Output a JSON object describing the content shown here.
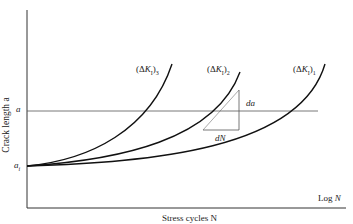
{
  "figure": {
    "y_axis_label": "Crack length a",
    "x_axis_label": "Stress cycles N",
    "x_axis_scale_label": "Log N",
    "y_levels": {
      "a": "a",
      "a_i": "a_i"
    },
    "curves": [
      {
        "label": "(ΔK_I)_3",
        "text": "(ΔK",
        "sub1": "I",
        "sub2": "3"
      },
      {
        "label": "(ΔK_I)_2",
        "text": "(ΔK",
        "sub1": "I",
        "sub2": "2"
      },
      {
        "label": "(ΔK_I)_1",
        "text": "(ΔK",
        "sub1": "I",
        "sub2": "1"
      }
    ],
    "slope_triangle": {
      "vertical_label": "da",
      "horizontal_label": "dN"
    },
    "colors": {
      "axis": "#333333",
      "curve": "#111111",
      "guide": "#555555"
    }
  }
}
